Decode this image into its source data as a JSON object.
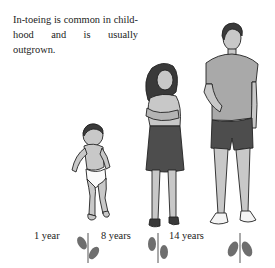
{
  "caption": {
    "line1": "In-toeing is common in child-",
    "line2": "hood and is usually outgrown."
  },
  "stages": [
    {
      "label": "1 year",
      "figure": "toddler-in-diaper",
      "footprint_angle": "toes-in"
    },
    {
      "label": "8 years",
      "figure": "girl-arms-crossed",
      "footprint_angle": "straight"
    },
    {
      "label": "14 years",
      "figure": "teen-boy-hand-on-hip",
      "footprint_angle": "toes-out"
    }
  ],
  "colors": {
    "footprint": "#6e6e6e",
    "skin": "#c8c8c8",
    "shirt": "#a9a9a9",
    "dark_clothing": "#4d4d4d",
    "hair": "#3a3a3a",
    "outline": "#222222"
  }
}
